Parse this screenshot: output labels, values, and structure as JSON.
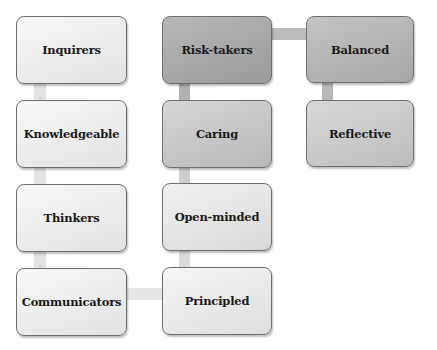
{
  "diagram": {
    "type": "process-flow",
    "nodes": [
      {
        "id": "inquirers",
        "label": "Inquirers",
        "column": 1,
        "row": 1,
        "x": 16,
        "y": 16,
        "w": 111,
        "h": 68,
        "fill_top": "#f8f8f8",
        "fill_bottom": "#e2e2e2"
      },
      {
        "id": "knowledgeable",
        "label": "Knowledgeable",
        "column": 1,
        "row": 2,
        "x": 16,
        "y": 100,
        "w": 111,
        "h": 68,
        "fill_top": "#f8f8f8",
        "fill_bottom": "#e2e2e2"
      },
      {
        "id": "thinkers",
        "label": "Thinkers",
        "column": 1,
        "row": 3,
        "x": 16,
        "y": 184,
        "w": 111,
        "h": 68,
        "fill_top": "#f8f8f8",
        "fill_bottom": "#e2e2e2"
      },
      {
        "id": "communicators",
        "label": "Communicators",
        "column": 1,
        "row": 4,
        "x": 16,
        "y": 268,
        "w": 111,
        "h": 68,
        "fill_top": "#f8f8f8",
        "fill_bottom": "#e2e2e2"
      },
      {
        "id": "principled",
        "label": "Principled",
        "column": 2,
        "row": 4,
        "x": 162,
        "y": 267,
        "w": 110,
        "h": 68,
        "fill_top": "#f6f6f6",
        "fill_bottom": "#dedede"
      },
      {
        "id": "open-minded",
        "label": "Open-minded",
        "column": 2,
        "row": 3,
        "x": 162,
        "y": 183,
        "w": 110,
        "h": 68,
        "fill_top": "#f2f2f2",
        "fill_bottom": "#d8d8d8"
      },
      {
        "id": "caring",
        "label": "Caring",
        "column": 2,
        "row": 2,
        "x": 162,
        "y": 100,
        "w": 110,
        "h": 68,
        "fill_top": "#d6d6d6",
        "fill_bottom": "#b8b8b8"
      },
      {
        "id": "risk-takers",
        "label": "Risk-takers",
        "column": 2,
        "row": 1,
        "x": 162,
        "y": 16,
        "w": 110,
        "h": 68,
        "fill_top": "#b8b8b8",
        "fill_bottom": "#9a9a9a"
      },
      {
        "id": "balanced",
        "label": "Balanced",
        "column": 3,
        "row": 1,
        "x": 306,
        "y": 16,
        "w": 108,
        "h": 67,
        "fill_top": "#c4c4c4",
        "fill_bottom": "#a6a6a6"
      },
      {
        "id": "reflective",
        "label": "Reflective",
        "column": 3,
        "row": 2,
        "x": 306,
        "y": 100,
        "w": 108,
        "h": 67,
        "fill_top": "#d8d8d8",
        "fill_bottom": "#bdbdbd"
      }
    ],
    "connectors": [
      {
        "from": "inquirers",
        "to": "knowledgeable",
        "x": 34,
        "y": 83,
        "w": 12,
        "h": 18,
        "color": "#e2e2e2"
      },
      {
        "from": "knowledgeable",
        "to": "thinkers",
        "x": 34,
        "y": 167,
        "w": 12,
        "h": 18,
        "color": "#e2e2e2"
      },
      {
        "from": "thinkers",
        "to": "communicators",
        "x": 34,
        "y": 251,
        "w": 12,
        "h": 18,
        "color": "#e2e2e2"
      },
      {
        "from": "communicators",
        "to": "principled",
        "x": 126,
        "y": 288,
        "w": 37,
        "h": 12,
        "color": "#e6e6e6"
      },
      {
        "from": "principled",
        "to": "open-minded",
        "x": 179,
        "y": 250,
        "w": 11,
        "h": 18,
        "color": "#dcdcdc"
      },
      {
        "from": "open-minded",
        "to": "caring",
        "x": 179,
        "y": 167,
        "w": 11,
        "h": 17,
        "color": "#cfcfcf"
      },
      {
        "from": "caring",
        "to": "risk-takers",
        "x": 179,
        "y": 83,
        "w": 11,
        "h": 18,
        "color": "#b0b0b0"
      },
      {
        "from": "risk-takers",
        "to": "balanced",
        "x": 271,
        "y": 28,
        "w": 36,
        "h": 12,
        "color": "#bcbcbc"
      },
      {
        "from": "balanced",
        "to": "reflective",
        "x": 322,
        "y": 82,
        "w": 11,
        "h": 19,
        "color": "#b8b8b8"
      }
    ]
  }
}
